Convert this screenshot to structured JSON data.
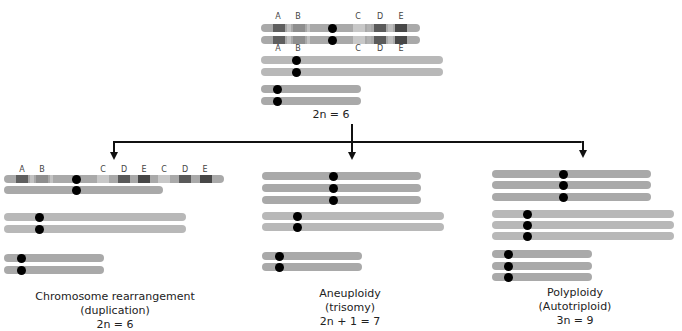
{
  "parent": {
    "label": "2n = 6",
    "band_labels_top": [
      "A",
      "B",
      "C",
      "D",
      "E"
    ],
    "band_labels_bottom": [
      "A",
      "B",
      "C",
      "D",
      "E"
    ]
  },
  "outcomes": [
    {
      "title": "Chromosome rearrangement",
      "subtitle": "(duplication)",
      "formula": "2n = 6",
      "band_labels": [
        "A",
        "B",
        "C",
        "D",
        "E",
        "C",
        "D",
        "E"
      ]
    },
    {
      "title": "Aneuploidy",
      "subtitle": "(trisomy)",
      "formula": "2n + 1 = 7"
    },
    {
      "title": "Polyploidy",
      "subtitle": "(Autotriploid)",
      "formula": "3n = 9"
    }
  ],
  "colors": {
    "chromosome": "#a9a9a9",
    "chromosome_light": "#b8b8b8",
    "band_dark": "#5a5a5a",
    "band_mid": "#8c8c8c",
    "band_light": "#c6c6c6",
    "centromere": "#000000"
  }
}
